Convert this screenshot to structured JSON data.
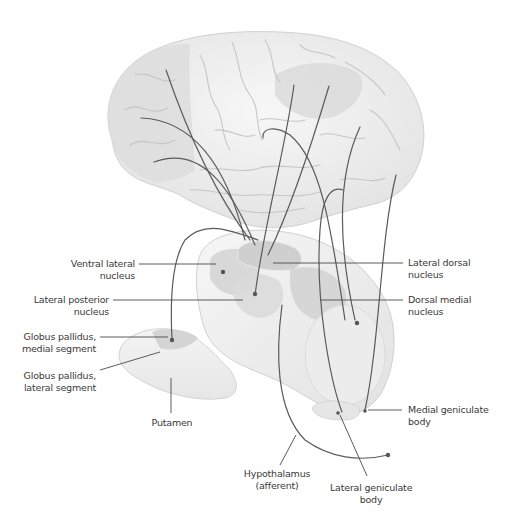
{
  "figure": {
    "colors": {
      "background": "#ffffff",
      "brain_fill": "#f2f2f2",
      "brain_shaded": "#dcdcdc",
      "thalamus_light": "#efefef",
      "thalamus_nucleus": "#d6d6d6",
      "fiber_line": "#5a5a5a",
      "leader_line": "#4a4a4a",
      "label_text": "#3a3a3a"
    }
  },
  "labels": {
    "ventral_lateral": [
      "Ventral lateral",
      "nucleus"
    ],
    "lateral_posterior": [
      "Lateral posterior",
      "nucleus"
    ],
    "gp_medial": [
      "Globus pallidus,",
      "medial segment"
    ],
    "gp_lateral": [
      "Globus pallidus,",
      "lateral segment"
    ],
    "putamen": [
      "Putamen"
    ],
    "lateral_dorsal": [
      "Lateral dorsal",
      "nucleus"
    ],
    "dorsal_medial": [
      "Dorsal medial",
      "nucleus"
    ],
    "medial_geniculate": [
      "Medial geniculate",
      "body"
    ],
    "hypothalamus": [
      "Hypothalamus",
      "(afferent)"
    ],
    "lateral_geniculate": [
      "Lateral geniculate",
      "body"
    ]
  }
}
